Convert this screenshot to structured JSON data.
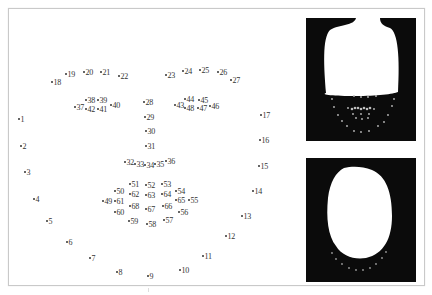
{
  "figure": {
    "colors": {
      "background": "#ffffff",
      "frame": "#c9c9c9",
      "text": "#333333",
      "mask_bg": "#0b0b0b",
      "mask_fg": "#ffffff"
    }
  },
  "landmarks": [
    {
      "id": "1",
      "x": 19,
      "y": 120
    },
    {
      "id": "2",
      "x": 21,
      "y": 147
    },
    {
      "id": "3",
      "x": 25,
      "y": 173
    },
    {
      "id": "4",
      "x": 34,
      "y": 200
    },
    {
      "id": "5",
      "x": 47,
      "y": 222
    },
    {
      "id": "6",
      "x": 67,
      "y": 243
    },
    {
      "id": "7",
      "x": 90,
      "y": 259
    },
    {
      "id": "8",
      "x": 117,
      "y": 273
    },
    {
      "id": "9",
      "x": 148,
      "y": 277
    },
    {
      "id": "10",
      "x": 180,
      "y": 271
    },
    {
      "id": "11",
      "x": 203,
      "y": 257
    },
    {
      "id": "12",
      "x": 226,
      "y": 237
    },
    {
      "id": "13",
      "x": 242,
      "y": 217
    },
    {
      "id": "14",
      "x": 253,
      "y": 192
    },
    {
      "id": "15",
      "x": 259,
      "y": 167
    },
    {
      "id": "16",
      "x": 260,
      "y": 141
    },
    {
      "id": "17",
      "x": 261,
      "y": 116
    },
    {
      "id": "18",
      "x": 52,
      "y": 83
    },
    {
      "id": "19",
      "x": 66,
      "y": 75
    },
    {
      "id": "20",
      "x": 84,
      "y": 73
    },
    {
      "id": "21",
      "x": 101,
      "y": 73
    },
    {
      "id": "22",
      "x": 119,
      "y": 77
    },
    {
      "id": "23",
      "x": 166,
      "y": 76
    },
    {
      "id": "24",
      "x": 183,
      "y": 72
    },
    {
      "id": "25",
      "x": 200,
      "y": 71
    },
    {
      "id": "26",
      "x": 218,
      "y": 73
    },
    {
      "id": "27",
      "x": 231,
      "y": 81
    },
    {
      "id": "28",
      "x": 144,
      "y": 103
    },
    {
      "id": "29",
      "x": 145,
      "y": 118
    },
    {
      "id": "30",
      "x": 146,
      "y": 132
    },
    {
      "id": "31",
      "x": 146,
      "y": 147
    },
    {
      "id": "32",
      "x": 125,
      "y": 163
    },
    {
      "id": "33",
      "x": 135,
      "y": 165
    },
    {
      "id": "34",
      "x": 145,
      "y": 166
    },
    {
      "id": "35",
      "x": 155,
      "y": 165
    },
    {
      "id": "36",
      "x": 166,
      "y": 162
    },
    {
      "id": "37",
      "x": 75,
      "y": 108
    },
    {
      "id": "38",
      "x": 86,
      "y": 101
    },
    {
      "id": "39",
      "x": 98,
      "y": 101
    },
    {
      "id": "40",
      "x": 111,
      "y": 106
    },
    {
      "id": "41",
      "x": 98,
      "y": 110
    },
    {
      "id": "42",
      "x": 86,
      "y": 110
    },
    {
      "id": "43",
      "x": 175,
      "y": 106
    },
    {
      "id": "44",
      "x": 185,
      "y": 100
    },
    {
      "id": "45",
      "x": 199,
      "y": 101
    },
    {
      "id": "46",
      "x": 210,
      "y": 107
    },
    {
      "id": "47",
      "x": 198,
      "y": 109
    },
    {
      "id": "48",
      "x": 185,
      "y": 109
    },
    {
      "id": "49",
      "x": 103,
      "y": 202
    },
    {
      "id": "50",
      "x": 115,
      "y": 192
    },
    {
      "id": "51",
      "x": 130,
      "y": 185
    },
    {
      "id": "52",
      "x": 146,
      "y": 186
    },
    {
      "id": "53",
      "x": 162,
      "y": 185
    },
    {
      "id": "54",
      "x": 176,
      "y": 192
    },
    {
      "id": "55",
      "x": 189,
      "y": 201
    },
    {
      "id": "56",
      "x": 179,
      "y": 213
    },
    {
      "id": "57",
      "x": 164,
      "y": 221
    },
    {
      "id": "58",
      "x": 147,
      "y": 225
    },
    {
      "id": "59",
      "x": 129,
      "y": 222
    },
    {
      "id": "60",
      "x": 115,
      "y": 213
    },
    {
      "id": "61",
      "x": 115,
      "y": 202
    },
    {
      "id": "62",
      "x": 130,
      "y": 195
    },
    {
      "id": "63",
      "x": 146,
      "y": 196
    },
    {
      "id": "64",
      "x": 162,
      "y": 195
    },
    {
      "id": "65",
      "x": 176,
      "y": 201
    },
    {
      "id": "66",
      "x": 163,
      "y": 207
    },
    {
      "id": "67",
      "x": 146,
      "y": 210
    },
    {
      "id": "68",
      "x": 130,
      "y": 207
    }
  ],
  "panels": [
    {
      "name": "mask-top",
      "x": 306,
      "y": 18,
      "w": 110,
      "h": 123
    },
    {
      "name": "mask-bottom",
      "x": 306,
      "y": 158,
      "w": 110,
      "h": 124
    }
  ]
}
